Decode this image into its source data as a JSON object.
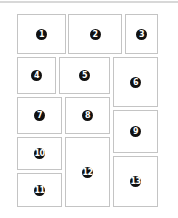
{
  "layout": {
    "boxes": [
      {
        "label": "1",
        "x": 17,
        "y": 14,
        "w": 49,
        "h": 40
      },
      {
        "label": "2",
        "x": 68,
        "y": 14,
        "w": 54,
        "h": 40
      },
      {
        "label": "3",
        "x": 125,
        "y": 14,
        "w": 33,
        "h": 40
      },
      {
        "label": "4",
        "x": 17,
        "y": 57,
        "w": 39,
        "h": 37
      },
      {
        "label": "5",
        "x": 59,
        "y": 57,
        "w": 51,
        "h": 37
      },
      {
        "label": "6",
        "x": 113,
        "y": 57,
        "w": 45,
        "h": 50
      },
      {
        "label": "7",
        "x": 17,
        "y": 97,
        "w": 45,
        "h": 37
      },
      {
        "label": "8",
        "x": 65,
        "y": 97,
        "w": 45,
        "h": 37
      },
      {
        "label": "9",
        "x": 113,
        "y": 110,
        "w": 45,
        "h": 43
      },
      {
        "label": "10",
        "x": 17,
        "y": 137,
        "w": 45,
        "h": 33
      },
      {
        "label": "11",
        "x": 17,
        "y": 173,
        "w": 45,
        "h": 34
      },
      {
        "label": "12",
        "x": 65,
        "y": 137,
        "w": 45,
        "h": 70
      },
      {
        "label": "13",
        "x": 113,
        "y": 156,
        "w": 45,
        "h": 51
      }
    ]
  }
}
